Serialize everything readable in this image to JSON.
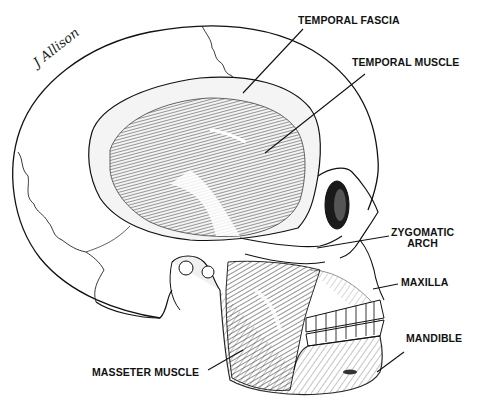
{
  "figure": {
    "signature": "J Allison",
    "colors": {
      "ink": "#111111",
      "background": "#ffffff",
      "shade": "#555555"
    }
  },
  "labels": {
    "temporal_fascia": "TEMPORAL FASCIA",
    "temporal_muscle": "TEMPORAL MUSCLE",
    "zygomatic_arch_line1": "ZYGOMATIC",
    "zygomatic_arch_line2": "ARCH",
    "maxilla": "MAXILLA",
    "mandible": "MANDIBLE",
    "masseter_muscle": "MASSETER MUSCLE"
  }
}
